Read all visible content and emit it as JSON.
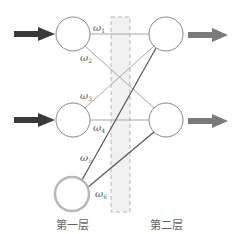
{
  "diagram": {
    "type": "neural-network",
    "layers": [
      {
        "label": "第一层",
        "nodes": [
          "input-1",
          "input-2",
          "bias"
        ]
      },
      {
        "label": "第二层",
        "nodes": [
          "output-1",
          "output-2"
        ]
      }
    ],
    "weights": [
      {
        "symbol": "ω",
        "sub": "1",
        "from": "input-1",
        "to": "output-1"
      },
      {
        "symbol": "ω",
        "sub": "2",
        "from": "input-1",
        "to": "output-2"
      },
      {
        "symbol": "ω",
        "sub": "3",
        "from": "input-2",
        "to": "output-1"
      },
      {
        "symbol": "ω",
        "sub": "4",
        "from": "input-2",
        "to": "output-2"
      },
      {
        "symbol": "ω",
        "sub": "5",
        "from": "bias",
        "to": "output-1"
      },
      {
        "symbol": "ω",
        "sub": "6",
        "from": "bias",
        "to": "output-2"
      }
    ],
    "colors": {
      "input_arrow": "#3a3a3a",
      "output_arrow": "#7a7a7a",
      "node_stroke": "#888888",
      "bias_stroke": "#b0b0b0",
      "light_edge": "#a8a8a8",
      "dark_edge": "#555555",
      "highlight_band": "#f0f0f0",
      "band_border": "#b5b5b5"
    }
  },
  "labels": {
    "layer1": "第一层",
    "layer2": "第二层",
    "w1_sym": "ω",
    "w1_sub": "1",
    "w2_sym": "ω",
    "w2_sub": "2",
    "w3_sym": "ω",
    "w3_sub": "3",
    "w4_sym": "ω",
    "w4_sub": "4",
    "w5_sym": "ω",
    "w5_sub": "5",
    "w6_sym": "ω",
    "w6_sub": "6"
  }
}
